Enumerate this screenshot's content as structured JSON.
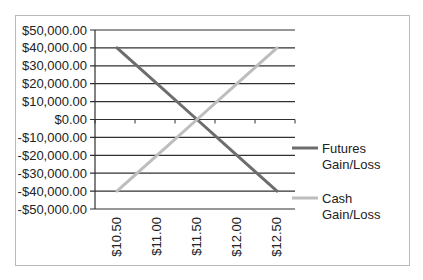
{
  "chart_data": {
    "type": "line",
    "title": "",
    "xlabel": "",
    "ylabel": "",
    "categories": [
      "$10.50",
      "$11.00",
      "$11.50",
      "$12.00",
      "$12.50"
    ],
    "x": [
      10.5,
      11.0,
      11.5,
      12.0,
      12.5
    ],
    "ylim": [
      -50000,
      50000
    ],
    "y_ticks": [
      50000,
      40000,
      30000,
      20000,
      10000,
      0,
      -10000,
      -20000,
      -30000,
      -40000,
      -50000
    ],
    "y_tick_labels": [
      "$50,000.00",
      "$40,000.00",
      "$30,000.00",
      "$20,000.00",
      "$10,000.00",
      "$0.00",
      "-$10,000.00",
      "-$20,000.00",
      "-$30,000.00",
      "-$40,000.00",
      "-$50,000.00"
    ],
    "grid": true,
    "legend_position": "right",
    "series": [
      {
        "name": "Futures Gain/Loss",
        "legend_lines": [
          "Futures",
          "Gain/Loss"
        ],
        "color": "#6d6d6d",
        "values": [
          40000,
          20000,
          0,
          -20000,
          -40000
        ]
      },
      {
        "name": "Cash Gain/Loss",
        "legend_lines": [
          "Cash",
          "Gain/Loss"
        ],
        "color": "#bdbdbd",
        "values": [
          -40000,
          -20000,
          0,
          20000,
          40000
        ]
      }
    ]
  }
}
